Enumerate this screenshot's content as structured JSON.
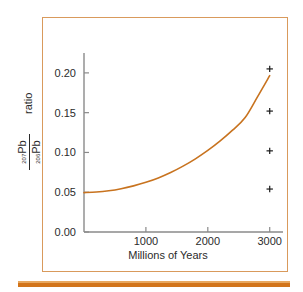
{
  "figure": {
    "frame_color": "#d99a5c",
    "accent_rule_color": "#d2741a",
    "background_color": "#ffffff"
  },
  "chart_data": {
    "type": "line",
    "title": "",
    "subtitle": "",
    "xlabel": "Millions of Years",
    "ylabel": "207Pb/206Pb ratio",
    "ylabel_numerator": "207",
    "ylabel_numerator_base": "Pb",
    "ylabel_denominator": "206",
    "ylabel_denominator_base": "Pb",
    "ylabel_suffix": "ratio",
    "xlim": [
      0,
      3150
    ],
    "ylim": [
      0.0,
      0.225
    ],
    "xticks": [
      1000,
      2000,
      3000
    ],
    "xtick_labels": [
      "1000",
      "2000",
      "3000"
    ],
    "yticks": [
      0.0,
      0.05,
      0.1,
      0.15,
      0.2
    ],
    "ytick_labels": [
      "0.00",
      "0.05",
      "0.10",
      "0.15",
      "0.20"
    ],
    "grid": false,
    "legend": false,
    "legend_position": "none",
    "series": [
      {
        "name": "207Pb/206Pb growth curve",
        "type": "line",
        "color": "#c8731f",
        "x": [
          0,
          200,
          400,
          600,
          800,
          1000,
          1200,
          1400,
          1600,
          1800,
          2000,
          2200,
          2400,
          2600,
          2800,
          3000
        ],
        "values": [
          0.0495,
          0.0502,
          0.0518,
          0.0544,
          0.058,
          0.0625,
          0.068,
          0.0748,
          0.0828,
          0.092,
          0.1025,
          0.1145,
          0.128,
          0.1435,
          0.1695,
          0.1965
        ]
      },
      {
        "name": "sample measurements",
        "type": "scatter",
        "marker": "plus",
        "color": "#1a1a1a",
        "x": [
          3000,
          3000,
          3000,
          3000
        ],
        "values": [
          0.205,
          0.152,
          0.102,
          0.054
        ]
      }
    ]
  },
  "annotations": []
}
